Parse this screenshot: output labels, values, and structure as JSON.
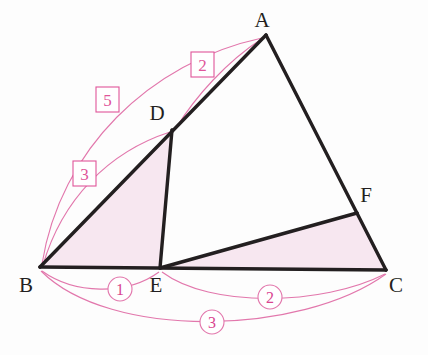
{
  "figure": {
    "background_color": "#fdfdfd",
    "stroke_color": "#231f20",
    "accent_color": "#e0559a",
    "arc_color": "#e87ab0",
    "fill_color": "#f7e7f0"
  },
  "vertices": {
    "A": {
      "label": "A",
      "x": 266,
      "y": 35,
      "label_x": 262,
      "label_y": 27
    },
    "B": {
      "label": "B",
      "x": 40,
      "y": 267,
      "label_x": 26,
      "label_y": 292
    },
    "C": {
      "label": "C",
      "x": 386,
      "y": 270,
      "label_x": 396,
      "label_y": 292
    },
    "D": {
      "label": "D",
      "x": 172,
      "y": 130,
      "label_x": 157,
      "label_y": 120
    },
    "E": {
      "label": "E",
      "x": 160,
      "y": 268,
      "label_x": 156,
      "label_y": 292
    },
    "F": {
      "label": "F",
      "x": 357,
      "y": 213,
      "label_x": 366,
      "label_y": 202
    }
  },
  "segments": [
    {
      "name": "side-AB",
      "from": "B",
      "to": "A"
    },
    {
      "name": "side-AC",
      "from": "A",
      "to": "C"
    },
    {
      "name": "side-BC",
      "from": "B",
      "to": "C"
    },
    {
      "name": "cevian-DE",
      "from": "D",
      "to": "E"
    },
    {
      "name": "cevian-EF",
      "from": "E",
      "to": "F"
    }
  ],
  "shaded_regions": [
    {
      "name": "triangle-BDE",
      "points": "40,267 172,130 160,268"
    },
    {
      "name": "triangle-EFC",
      "points": "160,268 357,213 386,270"
    }
  ],
  "box_labels": [
    {
      "name": "ratio-label-AD",
      "value": "2",
      "x": 202,
      "y": 65,
      "arc": "D-to-A"
    },
    {
      "name": "ratio-label-BA",
      "value": "5",
      "x": 107,
      "y": 100,
      "arc": "B-to-A"
    },
    {
      "name": "ratio-label-BD",
      "value": "3",
      "x": 84,
      "y": 174,
      "arc": "B-to-D"
    }
  ],
  "circle_labels": [
    {
      "name": "ratio-label-BE",
      "value": "1",
      "x": 120,
      "y": 289,
      "arc": "B-to-E"
    },
    {
      "name": "ratio-label-EC",
      "value": "2",
      "x": 270,
      "y": 297,
      "arc": "E-to-C"
    },
    {
      "name": "ratio-label-BC",
      "value": "3",
      "x": 212,
      "y": 322,
      "arc": "B-to-C"
    }
  ],
  "arcs": [
    {
      "name": "arc-B-to-A",
      "label": "5",
      "d": "M 42 264 C 60 150 150 62 262 38"
    },
    {
      "name": "arc-B-to-D",
      "label": "3",
      "d": "M 43 265 C 62 200 108 152 170 132"
    },
    {
      "name": "arc-D-to-A",
      "label": "2",
      "d": "M 176 128 C 196 96 226 62 263 38"
    },
    {
      "name": "arc-B-to-E",
      "label": "1",
      "d": "M 42 271 C 74 294 126 296 159 272"
    },
    {
      "name": "arc-E-to-C",
      "label": "2",
      "d": "M 162 272 C 210 308 322 306 385 274"
    },
    {
      "name": "arc-B-to-C",
      "label": "3",
      "d": "M 41 271 C 110 340 300 336 386 274"
    }
  ]
}
